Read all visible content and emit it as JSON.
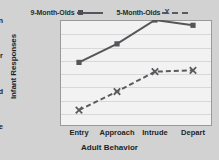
{
  "chart_data": {
    "type": "line",
    "title": "",
    "xlabel": "Adult Behavior",
    "ylabel": "Infant Responses",
    "categories": [
      "Entry",
      "Approach",
      "Intrude",
      "Depart"
    ],
    "ytick_labels": [
      "Smile",
      "Fascinated",
      "Somber",
      "Frown"
    ],
    "ytick_values": [
      0,
      2.67,
      5.33,
      8
    ],
    "ylim": [
      0,
      8
    ],
    "grid": true,
    "gridline_count": 8,
    "legend_position": "top-center",
    "series": [
      {
        "name": "9-Month-Olds",
        "marker": "square",
        "linestyle": "solid",
        "color": "#55555a",
        "values": [
          4.8,
          6.2,
          8.0,
          7.6
        ]
      },
      {
        "name": "5-Month-Olds",
        "marker": "x",
        "linestyle": "dashed",
        "color": "#5a5a5f",
        "values": [
          1.2,
          2.6,
          4.1,
          4.2
        ]
      }
    ]
  },
  "colors": {
    "outer_background": "#d2d2d2",
    "plot_background": "#f2f2f2",
    "gridline": "#d8d8d8",
    "frame": "#9a9a9a",
    "text": "#1f1f1f",
    "series_9mo": "#55555a",
    "series_5mo": "#5a5a5f"
  },
  "icons": {
    "square_marker": "square-marker-icon",
    "x_marker": "x-marker-icon"
  }
}
